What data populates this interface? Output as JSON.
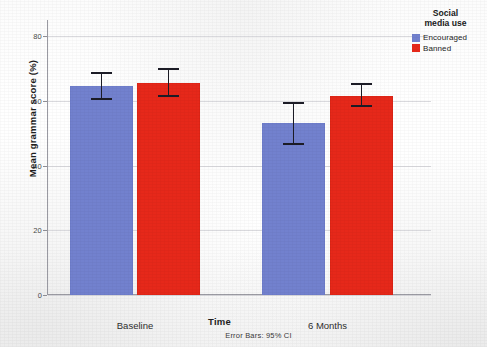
{
  "chart_data": {
    "type": "bar",
    "title": "",
    "subtitle": "",
    "xlabel": "Time",
    "ylabel": "Mean grammar score (%)",
    "categories": [
      "Baseline",
      "6 Months"
    ],
    "ylim": [
      0,
      85
    ],
    "yticks": [
      0,
      20,
      40,
      60,
      80
    ],
    "ytick_labels": [
      "0",
      "20",
      "40",
      "60",
      "80"
    ],
    "grid": "horizontal",
    "legend_position": "right",
    "legend_title": "Social\nmedia use",
    "footnote": "Error Bars: 95% CI",
    "error_bar_type": "95% CI",
    "series": [
      {
        "name": "Encouraged",
        "color": "#7281CE",
        "values": [
          64.7,
          53.1
        ],
        "ci_low": [
          60.4,
          46.3
        ],
        "ci_high": [
          69.0,
          59.8
        ]
      },
      {
        "name": "Banned",
        "color": "#E6281A",
        "values": [
          65.6,
          61.6
        ],
        "ci_low": [
          61.1,
          58.0
        ],
        "ci_high": [
          70.1,
          65.6
        ]
      }
    ]
  },
  "legend": {
    "title": "Social\nmedia use",
    "items": [
      {
        "label": "Encouraged",
        "color": "#7281CE"
      },
      {
        "label": "Banned",
        "color": "#E6281A"
      }
    ]
  },
  "axes": {
    "x_title": "Time",
    "y_title": "Mean grammar score (%)"
  },
  "footnote": "Error Bars: 95% CI"
}
